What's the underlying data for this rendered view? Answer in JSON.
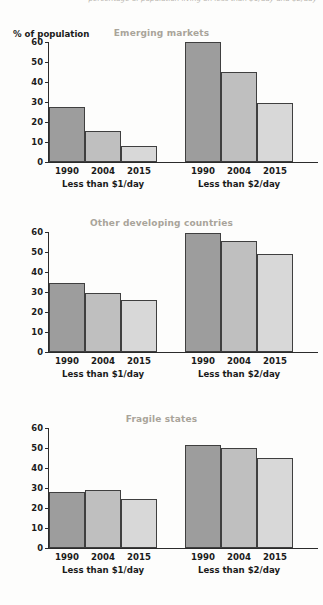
{
  "caption": {
    "text": "percentage of population living on less than $1/day and $2/day"
  },
  "axis": {
    "y_label": "% of population",
    "y_ticks": [
      0,
      10,
      20,
      30,
      40,
      50,
      60
    ]
  },
  "group_labels": [
    "Less than $1/day",
    "Less than $2/day"
  ],
  "series_labels": [
    "1990",
    "2004",
    "2015"
  ],
  "colors": {
    "bar_1990": "#9d9d9d",
    "bar_2004": "#bfbfbf",
    "bar_2015": "#d8d8d8",
    "bar_outline": "#3f3f3f",
    "title": "#a9a49a",
    "axis": "#2b2b2b",
    "background": "#fdfdfc"
  },
  "panels": [
    {
      "title": "Emerging markets"
    },
    {
      "title": "Other developing countries"
    },
    {
      "title": "Fragile states"
    }
  ],
  "chart_data": [
    {
      "type": "bar",
      "title": "Emerging markets",
      "xlabel": "",
      "ylabel": "% of population",
      "ylim": [
        0,
        60
      ],
      "yticks": [
        0,
        10,
        20,
        30,
        40,
        50,
        60
      ],
      "grid": false,
      "legend": "none",
      "categories": [
        "Less than $1/day",
        "Less than $2/day"
      ],
      "series": [
        {
          "name": "1990",
          "values": [
            27.5,
            60.0
          ]
        },
        {
          "name": "2004",
          "values": [
            15.5,
            45.0
          ]
        },
        {
          "name": "2015",
          "values": [
            8.0,
            29.5
          ]
        }
      ]
    },
    {
      "type": "bar",
      "title": "Other developing countries",
      "xlabel": "",
      "ylabel": "% of population",
      "ylim": [
        0,
        60
      ],
      "yticks": [
        0,
        10,
        20,
        30,
        40,
        50,
        60
      ],
      "grid": false,
      "legend": "none",
      "categories": [
        "Less than $1/day",
        "Less than $2/day"
      ],
      "series": [
        {
          "name": "1990",
          "values": [
            34.5,
            59.5
          ]
        },
        {
          "name": "2004",
          "values": [
            29.5,
            55.5
          ]
        },
        {
          "name": "2015",
          "values": [
            26.0,
            49.0
          ]
        }
      ]
    },
    {
      "type": "bar",
      "title": "Fragile states",
      "xlabel": "",
      "ylabel": "% of population",
      "ylim": [
        0,
        60
      ],
      "yticks": [
        0,
        10,
        20,
        30,
        40,
        50,
        60
      ],
      "grid": false,
      "legend": "none",
      "categories": [
        "Less than $1/day",
        "Less than $2/day"
      ],
      "series": [
        {
          "name": "1990",
          "values": [
            28.0,
            51.5
          ]
        },
        {
          "name": "2004",
          "values": [
            28.8,
            50.0
          ]
        },
        {
          "name": "2015",
          "values": [
            24.5,
            45.0
          ]
        }
      ]
    }
  ]
}
